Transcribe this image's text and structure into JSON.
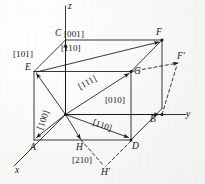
{
  "figure": {
    "kind": "crystallographic-direction-diagram",
    "background_color": "#fbfbfa",
    "ink_color": "#15151a"
  },
  "axes": [
    {
      "name": "z",
      "label": "z"
    },
    {
      "name": "y",
      "label": "y"
    },
    {
      "name": "x",
      "label": "x"
    }
  ],
  "vertices": [
    {
      "id": "A",
      "label": "A"
    },
    {
      "id": "B",
      "label": "B"
    },
    {
      "id": "C",
      "label": "C"
    },
    {
      "id": "D",
      "label": "D"
    },
    {
      "id": "E",
      "label": "E"
    },
    {
      "id": "F",
      "label": "F"
    },
    {
      "id": "G",
      "label": "G"
    },
    {
      "id": "H",
      "label": "H"
    },
    {
      "id": "Fp",
      "label": "F'"
    },
    {
      "id": "Hp",
      "label": "H'"
    }
  ],
  "miller_labels": [
    {
      "id": "m001",
      "label": "[001]"
    },
    {
      "id": "m101",
      "label": "[101]"
    },
    {
      "id": "m110top",
      "label": "[110]"
    },
    {
      "id": "m111",
      "label": "[111]"
    },
    {
      "id": "m100",
      "label": "[100]"
    },
    {
      "id": "m010",
      "label": "[010]"
    },
    {
      "id": "m110bot",
      "label": "[110]"
    },
    {
      "id": "m210",
      "label": "[210]"
    }
  ]
}
